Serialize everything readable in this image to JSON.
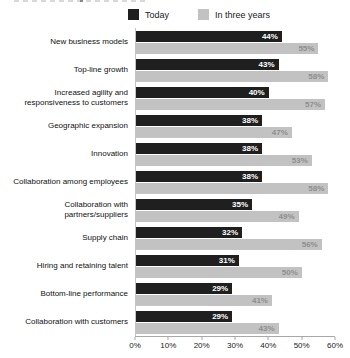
{
  "legend": {
    "items": [
      {
        "label": "Today",
        "color": "#1f1f1f"
      },
      {
        "label": "In three years",
        "color": "#c2c2c2"
      }
    ]
  },
  "chart_data": {
    "type": "bar",
    "orientation": "horizontal",
    "title": "",
    "categories": [
      "New business models",
      "Top-line growth",
      "Increased agility and responsiveness to customers",
      "Geographic expansion",
      "Innovation",
      "Collaboration among employees",
      "Collaboration with partners/suppliers",
      "Supply chain",
      "Hiring and retaining talent",
      "Bottom-line performance",
      "Collaboration with customers"
    ],
    "series": [
      {
        "name": "Today",
        "color": "#1f1f1f",
        "label_color": "#ffffff",
        "values": [
          44,
          43,
          40,
          38,
          38,
          38,
          35,
          32,
          31,
          29,
          29
        ]
      },
      {
        "name": "In three years",
        "color": "#c2c2c2",
        "label_color": "#8e8e8e",
        "values": [
          55,
          58,
          57,
          47,
          53,
          58,
          49,
          56,
          50,
          41,
          43
        ]
      }
    ],
    "value_suffix": "%",
    "xlim": [
      0,
      60
    ],
    "x_ticks": [
      "0%",
      "10%",
      "20%",
      "30%",
      "40%",
      "50%",
      "60%"
    ],
    "legend_position": "top",
    "grid": false
  }
}
